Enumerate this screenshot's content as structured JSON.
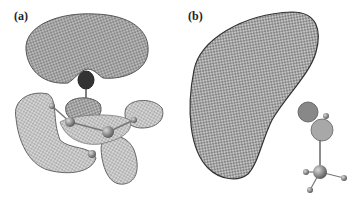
{
  "figure": {
    "panels": [
      {
        "id": "a",
        "label": "(a)",
        "content": "Wireframe orbital isosurface: large lobe above, multi-lobed density around molecule below"
      },
      {
        "id": "b",
        "label": "(b)",
        "content": "Wireframe crescent-shaped isosurface with small molecule (ball-and-stick) at lower right"
      }
    ]
  }
}
